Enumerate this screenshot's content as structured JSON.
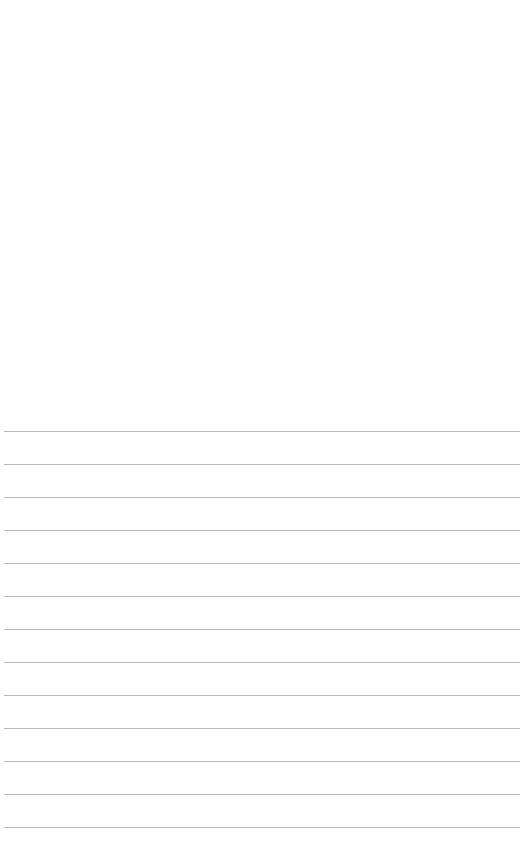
{
  "document": {
    "type": "lined-paper",
    "background_color": "#ffffff",
    "line_color": "#b9b9b9",
    "line_count": 13,
    "first_line_y": 431,
    "line_spacing": 33,
    "line_start_x": 4,
    "line_end_x": 520,
    "lines": [
      {
        "index": 1,
        "text": ""
      },
      {
        "index": 2,
        "text": ""
      },
      {
        "index": 3,
        "text": ""
      },
      {
        "index": 4,
        "text": ""
      },
      {
        "index": 5,
        "text": ""
      },
      {
        "index": 6,
        "text": ""
      },
      {
        "index": 7,
        "text": ""
      },
      {
        "index": 8,
        "text": ""
      },
      {
        "index": 9,
        "text": ""
      },
      {
        "index": 10,
        "text": ""
      },
      {
        "index": 11,
        "text": ""
      },
      {
        "index": 12,
        "text": ""
      },
      {
        "index": 13,
        "text": ""
      }
    ]
  }
}
